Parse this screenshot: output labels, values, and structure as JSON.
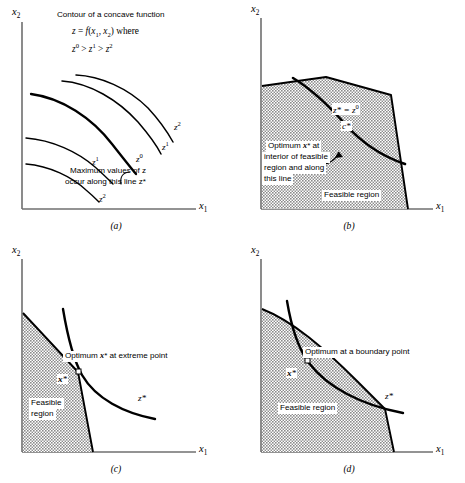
{
  "figure": {
    "panels": [
      {
        "id": "a",
        "caption": "(a)",
        "x_axis_label": "x",
        "x_axis_sub": "1",
        "y_axis_label": "x",
        "y_axis_sub": "2",
        "heading_line1": "Contour of a concave function",
        "heading_line2_prefix": "z = f(x",
        "heading_line2_sub1": "1",
        "heading_line2_mid": ", x",
        "heading_line2_sub2": "2",
        "heading_line2_suffix": ") where",
        "inequality": "z⁰ > z¹ > z²",
        "note_line1": "Maximum values of z",
        "note_line2": "occur along this line z*",
        "curve_labels": [
          {
            "text": "z",
            "sup": "2"
          },
          {
            "text": "z",
            "sup": "1"
          },
          {
            "text": "z",
            "sup": "1"
          },
          {
            "text": "z",
            "sup": "0"
          },
          {
            "text": "z",
            "sup": "2"
          }
        ]
      },
      {
        "id": "b",
        "caption": "(b)",
        "x_axis_label": "x",
        "x_axis_sub": "1",
        "y_axis_label": "x",
        "y_axis_sub": "2",
        "contour_label": "z* = z⁰",
        "c_label": "c*",
        "note_line1": "Optimum x* at",
        "note_line2": "interior of feasible",
        "note_line3": "region and along",
        "note_line4": "this line",
        "feasible_label": "Feasible region"
      },
      {
        "id": "c",
        "caption": "(c)",
        "x_axis_label": "x",
        "x_axis_sub": "1",
        "y_axis_label": "x",
        "y_axis_sub": "2",
        "note": "Optimum x* at extreme point",
        "point_label": "x*",
        "feasible_line1": "Feasible",
        "feasible_line2": "region",
        "z_label": "z*"
      },
      {
        "id": "d",
        "caption": "(d)",
        "x_axis_label": "x",
        "x_axis_sub": "1",
        "y_axis_label": "x",
        "y_axis_sub": "2",
        "note": "Optimum at a boundary point",
        "point_label": "x*",
        "feasible_label": "Feasible region",
        "z_label": "z*"
      }
    ],
    "colors": {
      "axis": "#6f6f6f",
      "curve": "#000000",
      "shading": "#9a9a9a",
      "boundary": "#000000",
      "background": "#ffffff"
    }
  }
}
